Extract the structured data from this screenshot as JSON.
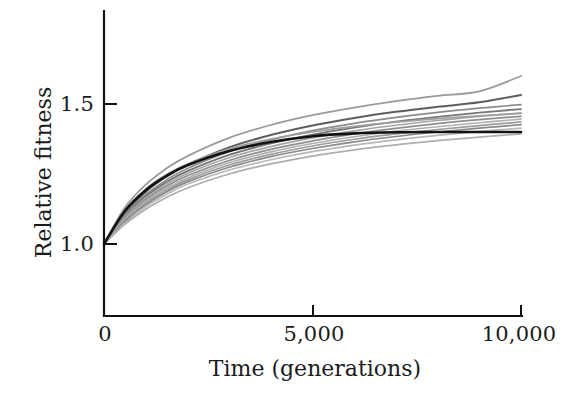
{
  "chart_data": {
    "type": "line",
    "title": "",
    "xlabel": "Time (generations)",
    "ylabel": "Relative fitness",
    "xlim": [
      0,
      10000
    ],
    "ylim": [
      0.85,
      1.72
    ],
    "grid": false,
    "legend": null,
    "x_ticks": [
      {
        "value": 0,
        "label": "0"
      },
      {
        "value": 5000,
        "label": "5,000"
      },
      {
        "value": 10000,
        "label": "10,000"
      }
    ],
    "y_ticks": [
      {
        "value": 1.0,
        "label": "1.0"
      },
      {
        "value": 1.5,
        "label": "1.5"
      }
    ],
    "x": [
      0,
      500,
      1000,
      1500,
      2000,
      3000,
      4000,
      5000,
      6000,
      7000,
      8000,
      9000,
      10000
    ],
    "series": [
      {
        "name": "population-1",
        "color": "#9a9a9a",
        "width": 1.8,
        "values": [
          1.0,
          1.13,
          1.212,
          1.27,
          1.314,
          1.379,
          1.425,
          1.46,
          1.487,
          1.51,
          1.529,
          1.545,
          1.6
        ]
      },
      {
        "name": "population-2",
        "color": "#5e5e5e",
        "width": 2.0,
        "values": [
          1.0,
          1.11,
          1.186,
          1.241,
          1.283,
          1.345,
          1.389,
          1.423,
          1.45,
          1.472,
          1.49,
          1.506,
          1.532
        ]
      },
      {
        "name": "population-3",
        "color": "#8c8c8c",
        "width": 1.7,
        "values": [
          1.0,
          1.104,
          1.176,
          1.229,
          1.27,
          1.33,
          1.372,
          1.405,
          1.431,
          1.452,
          1.47,
          1.485,
          1.498
        ]
      },
      {
        "name": "population-4",
        "color": "#757575",
        "width": 1.8,
        "values": [
          1.0,
          1.1,
          1.17,
          1.221,
          1.26,
          1.318,
          1.359,
          1.391,
          1.416,
          1.437,
          1.454,
          1.469,
          1.482
        ]
      },
      {
        "name": "population-5",
        "color": "#a5a5a5",
        "width": 1.7,
        "values": [
          1.0,
          1.096,
          1.164,
          1.213,
          1.252,
          1.308,
          1.348,
          1.379,
          1.404,
          1.424,
          1.441,
          1.456,
          1.468
        ]
      },
      {
        "name": "population-6",
        "color": "#8f8f8f",
        "width": 1.7,
        "values": [
          1.0,
          1.092,
          1.158,
          1.206,
          1.244,
          1.298,
          1.338,
          1.368,
          1.393,
          1.413,
          1.43,
          1.444,
          1.456
        ]
      },
      {
        "name": "population-7",
        "color": "#b0b0b0",
        "width": 1.6,
        "values": [
          1.0,
          1.088,
          1.152,
          1.199,
          1.236,
          1.29,
          1.329,
          1.359,
          1.383,
          1.403,
          1.419,
          1.433,
          1.446
        ]
      },
      {
        "name": "population-8",
        "color": "#9c9c9c",
        "width": 1.7,
        "values": [
          1.0,
          1.084,
          1.146,
          1.192,
          1.229,
          1.282,
          1.32,
          1.35,
          1.374,
          1.393,
          1.409,
          1.423,
          1.436
        ]
      },
      {
        "name": "population-9",
        "color": "#8a8a8a",
        "width": 1.7,
        "values": [
          1.0,
          1.08,
          1.14,
          1.186,
          1.222,
          1.274,
          1.312,
          1.341,
          1.365,
          1.384,
          1.4,
          1.414,
          1.426
        ]
      },
      {
        "name": "population-10",
        "color": "#b8b8b8",
        "width": 1.6,
        "values": [
          1.0,
          1.075,
          1.133,
          1.177,
          1.213,
          1.264,
          1.301,
          1.33,
          1.353,
          1.372,
          1.388,
          1.402,
          1.414
        ]
      },
      {
        "name": "population-11",
        "color": "#a0a0a0",
        "width": 1.7,
        "values": [
          1.0,
          1.118,
          1.196,
          1.248,
          1.286,
          1.34,
          1.375,
          1.4,
          1.42,
          1.435,
          1.448,
          1.458,
          1.466
        ]
      },
      {
        "name": "population-12",
        "color": "#aeaeae",
        "width": 1.7,
        "values": [
          1.0,
          1.07,
          1.124,
          1.166,
          1.2,
          1.25,
          1.286,
          1.314,
          1.336,
          1.354,
          1.369,
          1.382,
          1.393
        ]
      },
      {
        "name": "population-mean",
        "color": "#121212",
        "width": 2.6,
        "values": [
          1.0,
          1.118,
          1.192,
          1.243,
          1.281,
          1.332,
          1.364,
          1.385,
          1.395,
          1.399,
          1.4,
          1.4,
          1.4
        ]
      }
    ]
  }
}
